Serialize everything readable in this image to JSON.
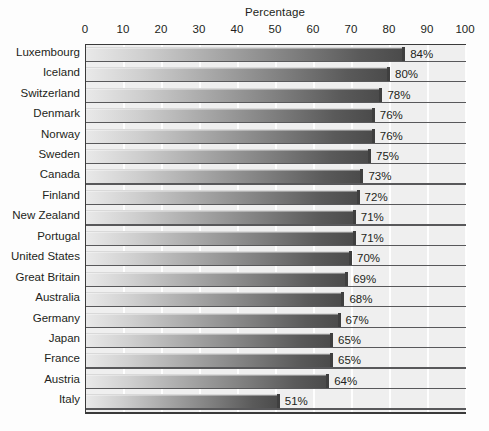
{
  "chart_data": {
    "type": "bar",
    "orientation": "horizontal",
    "title": "Percentage",
    "xlabel": "Percentage",
    "ylabel": "",
    "xlim": [
      0,
      100
    ],
    "xticks": [
      0,
      10,
      20,
      30,
      40,
      50,
      60,
      70,
      80,
      90,
      100
    ],
    "xtick_labels": [
      "0",
      "10",
      "20",
      "30",
      "40",
      "50",
      "60",
      "70",
      "80",
      "90",
      "100"
    ],
    "grid": true,
    "grid_axis": "x",
    "legend": false,
    "value_suffix": "%",
    "categories": [
      "Luxembourg",
      "Iceland",
      "Switzerland",
      "Denmark",
      "Norway",
      "Sweden",
      "Canada",
      "Finland",
      "New Zealand",
      "Portugal",
      "United States",
      "Great Britain",
      "Australia",
      "Germany",
      "Japan",
      "France",
      "Austria",
      "Italy"
    ],
    "values": [
      84,
      80,
      78,
      76,
      76,
      75,
      73,
      72,
      71,
      71,
      70,
      69,
      68,
      67,
      65,
      65,
      64,
      51
    ],
    "value_labels": [
      "84%",
      "80%",
      "78%",
      "76%",
      "76%",
      "75%",
      "73%",
      "72%",
      "71%",
      "71%",
      "70%",
      "69%",
      "68%",
      "67%",
      "65%",
      "65%",
      "64%",
      "51%"
    ],
    "colors": {
      "plot_background": "#efefef",
      "page_background": "#fdfdfd",
      "gridline": "#ffffff",
      "axis_line": "#3a3a3a",
      "bar_gradient_start": "#e9e9e9",
      "bar_gradient_end": "#4a4a4a",
      "text": "#231f20"
    }
  }
}
